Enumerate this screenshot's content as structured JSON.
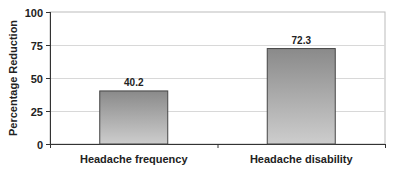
{
  "chart_data": {
    "type": "bar",
    "title": "",
    "xlabel": "",
    "ylabel": "Percentage Reduction",
    "categories": [
      "Headache frequency",
      "Headache disability"
    ],
    "values": [
      40.2,
      72.3
    ],
    "data_labels": [
      "40.2",
      "72.3"
    ],
    "ylim": [
      0,
      100
    ],
    "yticks": [
      0,
      25,
      50,
      75,
      100
    ],
    "grid": true,
    "legend": null,
    "bar_color_top": "#8a8a8a",
    "bar_color_bottom": "#c8c8c8"
  }
}
